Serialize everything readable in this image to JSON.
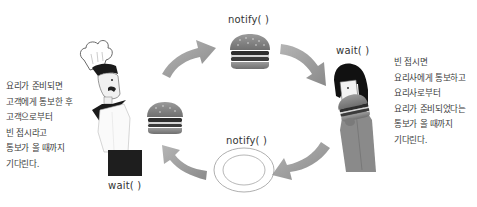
{
  "diagram": {
    "left_text": "요리가 준비되면\n고객에게 통보한 후\n고객으로부터\n빈 접시라고\n통보가 올 때까지\n기다린다.",
    "right_text": "빈 접시면\n요리사에게 통보하고\n요리사로부터\n요리가 준비되었다는\n통보가 올 때까지\n기다린다.",
    "labels": {
      "chef_wait": "wait( )",
      "top_notify": "notify( )",
      "customer_wait": "wait( )",
      "bottom_notify": "notify( )"
    },
    "characters": {
      "chef": "chef-illustration",
      "customer": "customer-illustration"
    },
    "colors": {
      "arrow": "#9a9a9a",
      "burger_bun": "#8a8a8a",
      "burger_patty": "#3a3a3a",
      "apron": "#1e1e1e",
      "hair": "#111111",
      "text": "#3c3c3c"
    }
  }
}
